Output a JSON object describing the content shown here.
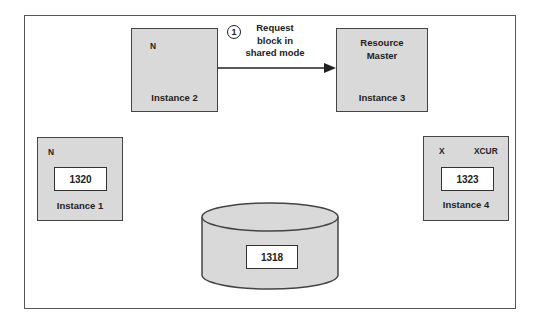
{
  "instances": {
    "instance1": {
      "label": "Instance 1",
      "mode": "N",
      "block": "1320"
    },
    "instance2": {
      "label": "Instance 2",
      "mode": "N"
    },
    "instance3": {
      "label": "Instance 3",
      "role_line1": "Resource",
      "role_line2": "Master"
    },
    "instance4": {
      "label": "Instance 4",
      "mode": "X",
      "state": "XCUR",
      "block": "1323"
    }
  },
  "disk": {
    "block": "1318"
  },
  "request": {
    "step": "1",
    "line1": "Request",
    "line2": "block in",
    "line3": "shared mode"
  },
  "colors": {
    "box_fill": "#d9d9d9",
    "border": "#444444",
    "background": "#ffffff"
  }
}
